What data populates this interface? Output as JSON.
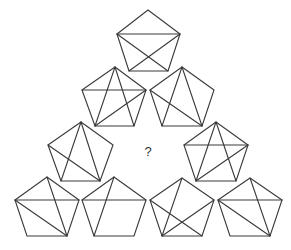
{
  "puzzle": {
    "question_mark": "?",
    "question_position": [
      148,
      151
    ],
    "stroke_color": "#3a3a3a",
    "background": "#ffffff",
    "pentagons": [
      {
        "id": "row1-center",
        "vertices": {
          "top": [
            148,
            10
          ],
          "left": [
            117,
            34
          ],
          "right": [
            180,
            34
          ],
          "bl": [
            129,
            71
          ],
          "br": [
            168,
            71
          ]
        },
        "diagonals": [
          [
            "left",
            "right"
          ],
          [
            "left",
            "br"
          ],
          [
            "right",
            "bl"
          ]
        ]
      },
      {
        "id": "row2-left",
        "vertices": {
          "top": [
            115,
            67
          ],
          "left": [
            82,
            90
          ],
          "right": [
            146,
            90
          ],
          "bl": [
            95,
            126
          ],
          "br": [
            134,
            126
          ]
        },
        "diagonals": [
          [
            "left",
            "right"
          ],
          [
            "top",
            "bl"
          ],
          [
            "top",
            "br"
          ],
          [
            "right",
            "bl"
          ]
        ]
      },
      {
        "id": "row2-right",
        "vertices": {
          "top": [
            182,
            67
          ],
          "left": [
            150,
            90
          ],
          "right": [
            214,
            90
          ],
          "bl": [
            162,
            126
          ],
          "br": [
            202,
            126
          ]
        },
        "diagonals": [
          [
            "top",
            "bl"
          ],
          [
            "top",
            "br"
          ],
          [
            "left",
            "br"
          ]
        ]
      },
      {
        "id": "row3-left",
        "vertices": {
          "top": [
            81,
            122
          ],
          "left": [
            48,
            145
          ],
          "right": [
            113,
            145
          ],
          "bl": [
            61,
            181
          ],
          "br": [
            100,
            181
          ]
        },
        "diagonals": [
          [
            "top",
            "bl"
          ],
          [
            "top",
            "br"
          ],
          [
            "left",
            "br"
          ]
        ]
      },
      {
        "id": "row3-right",
        "vertices": {
          "top": [
            216,
            122
          ],
          "left": [
            184,
            145
          ],
          "right": [
            248,
            145
          ],
          "bl": [
            196,
            181
          ],
          "br": [
            236,
            181
          ]
        },
        "diagonals": [
          [
            "left",
            "right"
          ],
          [
            "top",
            "bl"
          ],
          [
            "top",
            "br"
          ],
          [
            "right",
            "bl"
          ]
        ]
      },
      {
        "id": "row4-1",
        "vertices": {
          "top": [
            47,
            177
          ],
          "left": [
            15,
            200
          ],
          "right": [
            79,
            200
          ],
          "bl": [
            27,
            236
          ],
          "br": [
            67,
            236
          ]
        },
        "diagonals": [
          [
            "left",
            "right"
          ],
          [
            "top",
            "br"
          ],
          [
            "left",
            "br"
          ]
        ]
      },
      {
        "id": "row4-2",
        "vertices": {
          "top": [
            114,
            177
          ],
          "left": [
            82,
            200
          ],
          "right": [
            146,
            200
          ],
          "bl": [
            94,
            236
          ],
          "br": [
            134,
            236
          ]
        },
        "diagonals": [
          [
            "left",
            "right"
          ],
          [
            "top",
            "bl"
          ]
        ]
      },
      {
        "id": "row4-3",
        "vertices": {
          "top": [
            182,
            178
          ],
          "left": [
            150,
            200
          ],
          "right": [
            214,
            200
          ],
          "bl": [
            162,
            236
          ],
          "br": [
            202,
            236
          ]
        },
        "diagonals": [
          [
            "top",
            "bl"
          ],
          [
            "left",
            "br"
          ],
          [
            "right",
            "bl"
          ]
        ]
      },
      {
        "id": "row4-4",
        "vertices": {
          "top": [
            250,
            178
          ],
          "left": [
            218,
            200
          ],
          "right": [
            282,
            200
          ],
          "bl": [
            230,
            236
          ],
          "br": [
            270,
            236
          ]
        },
        "diagonals": [
          [
            "left",
            "right"
          ],
          [
            "top",
            "br"
          ],
          [
            "left",
            "br"
          ]
        ]
      }
    ]
  }
}
